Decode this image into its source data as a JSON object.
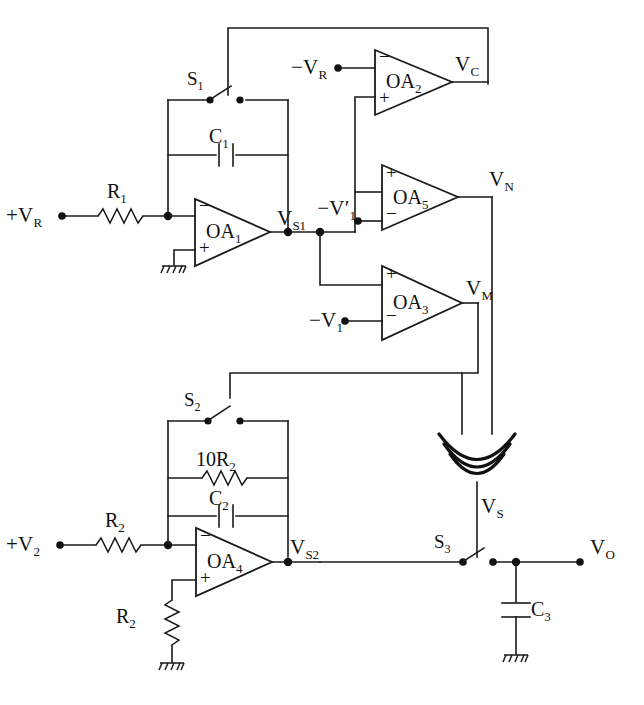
{
  "diagram": {
    "background": "#ffffff",
    "ink": "#111111"
  },
  "opamps": [
    {
      "id": "OA1",
      "label": "OA",
      "index": "1",
      "minus_pin": "−",
      "plus_pin": "+",
      "plus_position": "bottom"
    },
    {
      "id": "OA2",
      "label": "OA",
      "index": "2",
      "minus_pin": "−",
      "plus_pin": "+",
      "plus_position": "bottom"
    },
    {
      "id": "OA3",
      "label": "OA",
      "index": "3",
      "minus_pin": "−",
      "plus_pin": "+",
      "plus_position": "top"
    },
    {
      "id": "OA4",
      "label": "OA",
      "index": "4",
      "minus_pin": "−",
      "plus_pin": "+",
      "plus_position": "bottom"
    },
    {
      "id": "OA5",
      "label": "OA",
      "index": "5",
      "minus_pin": "−",
      "plus_pin": "+",
      "plus_position": "top"
    }
  ],
  "nodes": {
    "vr_pos": {
      "text": "+V",
      "sub": "R"
    },
    "vr_neg": {
      "text": "−V",
      "sub": "R"
    },
    "vc": {
      "text": "V",
      "sub": "C"
    },
    "vs1": {
      "text": "V",
      "sub": "S1"
    },
    "v1_prime_neg": {
      "text": "−V′",
      "sub": "1"
    },
    "v1_neg": {
      "text": "−V",
      "sub": "1"
    },
    "vn": {
      "text": "V",
      "sub": "N"
    },
    "vm": {
      "text": "V",
      "sub": "M"
    },
    "vs": {
      "text": "V",
      "sub": "S"
    },
    "v2_pos": {
      "text": "+V",
      "sub": "2"
    },
    "vs2": {
      "text": "V",
      "sub": "S2"
    },
    "vo": {
      "text": "V",
      "sub": "O"
    }
  },
  "components": {
    "r1": {
      "text": "R",
      "sub": "1",
      "type": "resistor"
    },
    "c1": {
      "text": "C",
      "sub": "1",
      "type": "capacitor"
    },
    "r2_input": {
      "text": "R",
      "sub": "2",
      "type": "resistor"
    },
    "r2_ground": {
      "text": "R",
      "sub": "2",
      "type": "resistor"
    },
    "r10_2": {
      "text": "10R",
      "sub": "2",
      "type": "resistor"
    },
    "c2": {
      "text": "C",
      "sub": "2",
      "type": "capacitor"
    },
    "c3": {
      "text": "C",
      "sub": "3",
      "type": "capacitor"
    }
  },
  "switches": [
    {
      "id": "S1",
      "text": "S",
      "sub": "1",
      "controlled_by": "VC"
    },
    {
      "id": "S2",
      "text": "S",
      "sub": "2",
      "controlled_by": "VM"
    },
    {
      "id": "S3",
      "text": "S",
      "sub": "3",
      "controlled_by": "VS"
    }
  ],
  "grounds": [
    {
      "id": "gnd-oa1",
      "attached_to": "OA1 plus input"
    },
    {
      "id": "gnd-r2",
      "attached_to": "R2 lower terminal"
    },
    {
      "id": "gnd-c3",
      "attached_to": "C3 lower terminal"
    }
  ],
  "merge_symbol": {
    "id": "merge",
    "inputs": [
      "VM",
      "VN"
    ],
    "output": "VS",
    "arcs": 3
  }
}
